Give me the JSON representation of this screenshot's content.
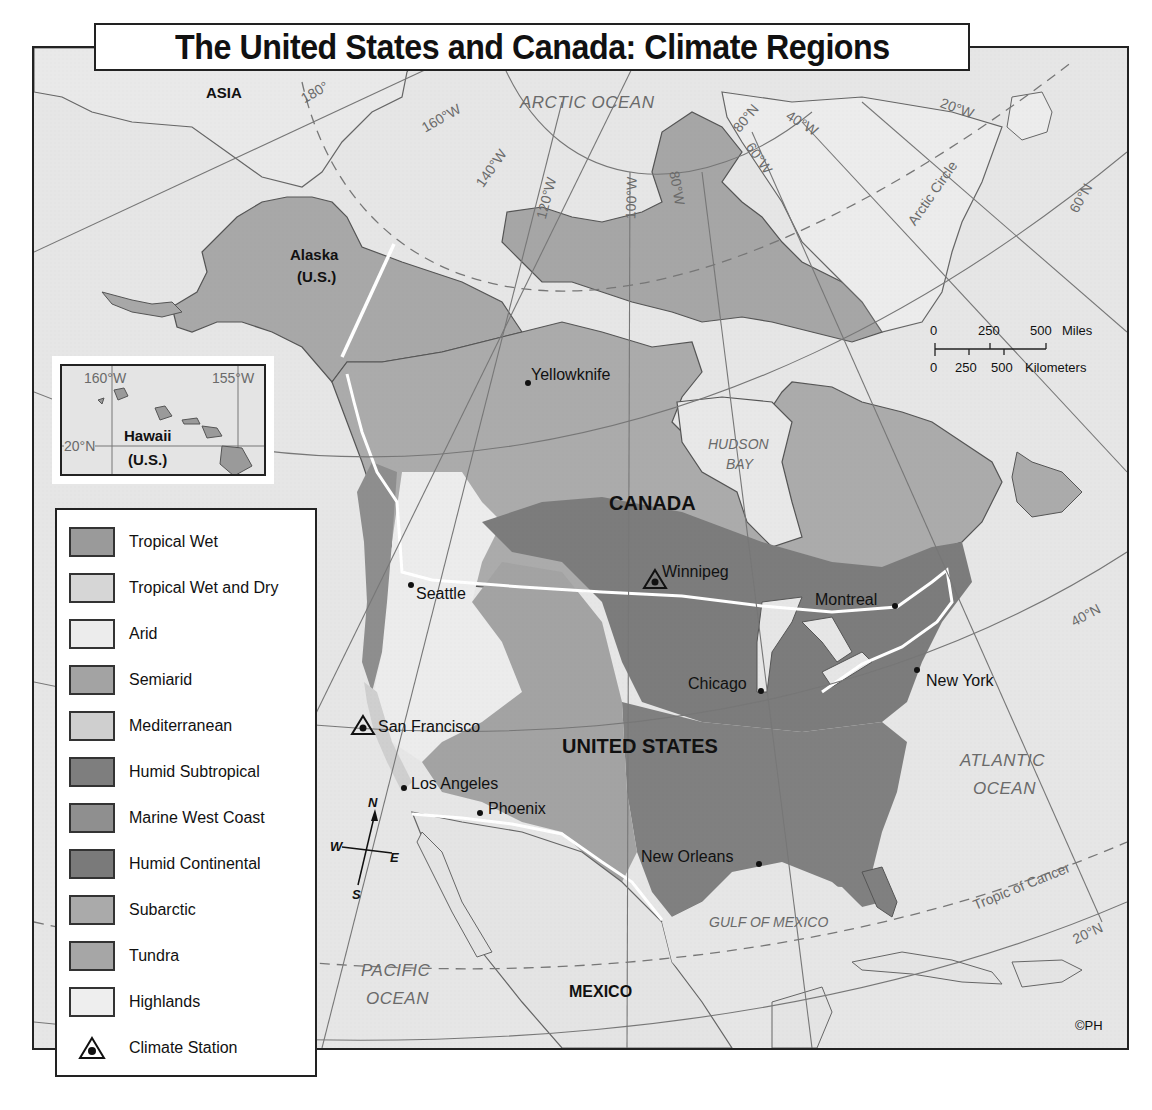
{
  "title": "The United States and Canada: Climate Regions",
  "colors": {
    "ocean": "#e6e6e6",
    "border_white": "#ffffff",
    "grid_line": "#777777",
    "tropical_wet": "#9a9a9a",
    "tropical_wet_and_dry": "#d6d6d6",
    "arid": "#ececec",
    "semiarid": "#a3a3a3",
    "mediterranean": "#cfcfcf",
    "humid_subtropical": "#7e7e7e",
    "marine_west_coast": "#8f8f8f",
    "humid_continental": "#7a7a7a",
    "subarctic": "#aaaaaa",
    "tundra": "#a6a6a6",
    "highlands": "#eeeeee"
  },
  "legend": {
    "items": [
      {
        "label": "Tropical Wet",
        "swatch": "#9a9a9a"
      },
      {
        "label": "Tropical Wet and Dry",
        "swatch": "#d6d6d6"
      },
      {
        "label": "Arid",
        "swatch": "#ececec"
      },
      {
        "label": "Semiarid",
        "swatch": "#a3a3a3"
      },
      {
        "label": "Mediterranean",
        "swatch": "#cfcfcf"
      },
      {
        "label": "Humid Subtropical",
        "swatch": "#7e7e7e"
      },
      {
        "label": "Marine West Coast",
        "swatch": "#8f8f8f"
      },
      {
        "label": "Humid Continental",
        "swatch": "#7a7a7a"
      },
      {
        "label": "Subarctic",
        "swatch": "#aaaaaa"
      },
      {
        "label": "Tundra",
        "swatch": "#a6a6a6"
      },
      {
        "label": "Highlands",
        "swatch": "#eeeeee"
      }
    ],
    "station_label": "Climate Station"
  },
  "regions": {
    "asia": "ASIA",
    "alaska": "Alaska",
    "alaska_sub": "(U.S.)",
    "canada": "CANADA",
    "united_states": "UNITED STATES",
    "mexico": "MEXICO"
  },
  "oceans": {
    "arctic": "ARCTIC OCEAN",
    "hudson_1": "HUDSON",
    "hudson_2": "BAY",
    "atlantic_1": "ATLANTIC",
    "atlantic_2": "OCEAN",
    "pacific_1": "PACIFIC",
    "pacific_2": "OCEAN",
    "gulf": "GULF OF MEXICO"
  },
  "cities": {
    "yellowknife": "Yellowknife",
    "winnipeg": "Winnipeg",
    "seattle": "Seattle",
    "montreal": "Montreal",
    "chicago": "Chicago",
    "new_york": "New York",
    "san_francisco": "San Francisco",
    "los_angeles": "Los Angeles",
    "phoenix": "Phoenix",
    "new_orleans": "New Orleans"
  },
  "grid_labels": {
    "lon_180": "180°",
    "lon_160w": "160°W",
    "lon_140w": "140°W",
    "lon_120w": "120°W",
    "lon_100w": "100°W",
    "lon_80w": "80°W",
    "lon_60w": "60°W",
    "lon_40w": "40°W",
    "lon_20w": "20°W",
    "lat_80n": "80°N",
    "lat_60n": "60°N",
    "lat_40n": "40°N",
    "lat_20n": "20°N",
    "arctic_circle": "Arctic Circle",
    "tropic_cancer": "Tropic of Cancer"
  },
  "inset": {
    "title": "Hawaii",
    "subtitle": "(U.S.)",
    "lon_left": "160°W",
    "lon_right": "155°W",
    "lat": "20°N"
  },
  "scale": {
    "miles_ticks": [
      "0",
      "250",
      "500"
    ],
    "miles_unit": "Miles",
    "km_ticks": [
      "0",
      "250",
      "500"
    ],
    "km_unit": "Kilometers"
  },
  "compass": {
    "n": "N",
    "s": "S",
    "e": "E",
    "w": "W"
  },
  "copyright": "©PH"
}
